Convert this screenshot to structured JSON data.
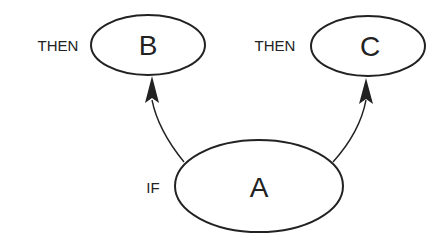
{
  "diagram": {
    "colors": {
      "stroke": "#222222",
      "background": "#ffffff"
    },
    "nodes": [
      {
        "id": "A",
        "label": "A",
        "side_label": "IF"
      },
      {
        "id": "B",
        "label": "B",
        "side_label": "THEN"
      },
      {
        "id": "C",
        "label": "C",
        "side_label": "THEN"
      }
    ],
    "edges": [
      {
        "from": "A",
        "to": "B"
      },
      {
        "from": "A",
        "to": "C"
      }
    ]
  }
}
